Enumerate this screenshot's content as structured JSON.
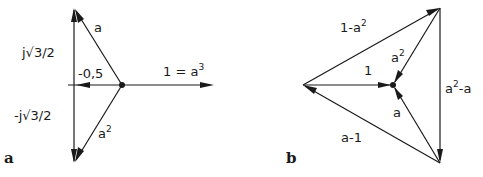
{
  "panels": {
    "a": {
      "panel_label": "a",
      "labels": {
        "a": "a",
        "a2_base": "a",
        "a2_exp": "2",
        "one_eq": "1 = a",
        "one_eq_exp": "3",
        "neg_half": "-0,5",
        "j_pos": "j√3/2",
        "j_neg": "-j√3/2"
      }
    },
    "b": {
      "panel_label": "b",
      "labels": {
        "one_minus_a2_base": "1-a",
        "one_minus_a2_exp": "2",
        "a2_base": "a",
        "a2_exp": "2",
        "one": "1",
        "a2_minus_a_base": "a",
        "a2_minus_a_exp": "2",
        "a2_minus_a_tail": "-a",
        "a": "a",
        "a_minus_1": "a-1"
      }
    }
  },
  "colors": {
    "ink": "#1a1a1a",
    "background": "#ffffff"
  }
}
